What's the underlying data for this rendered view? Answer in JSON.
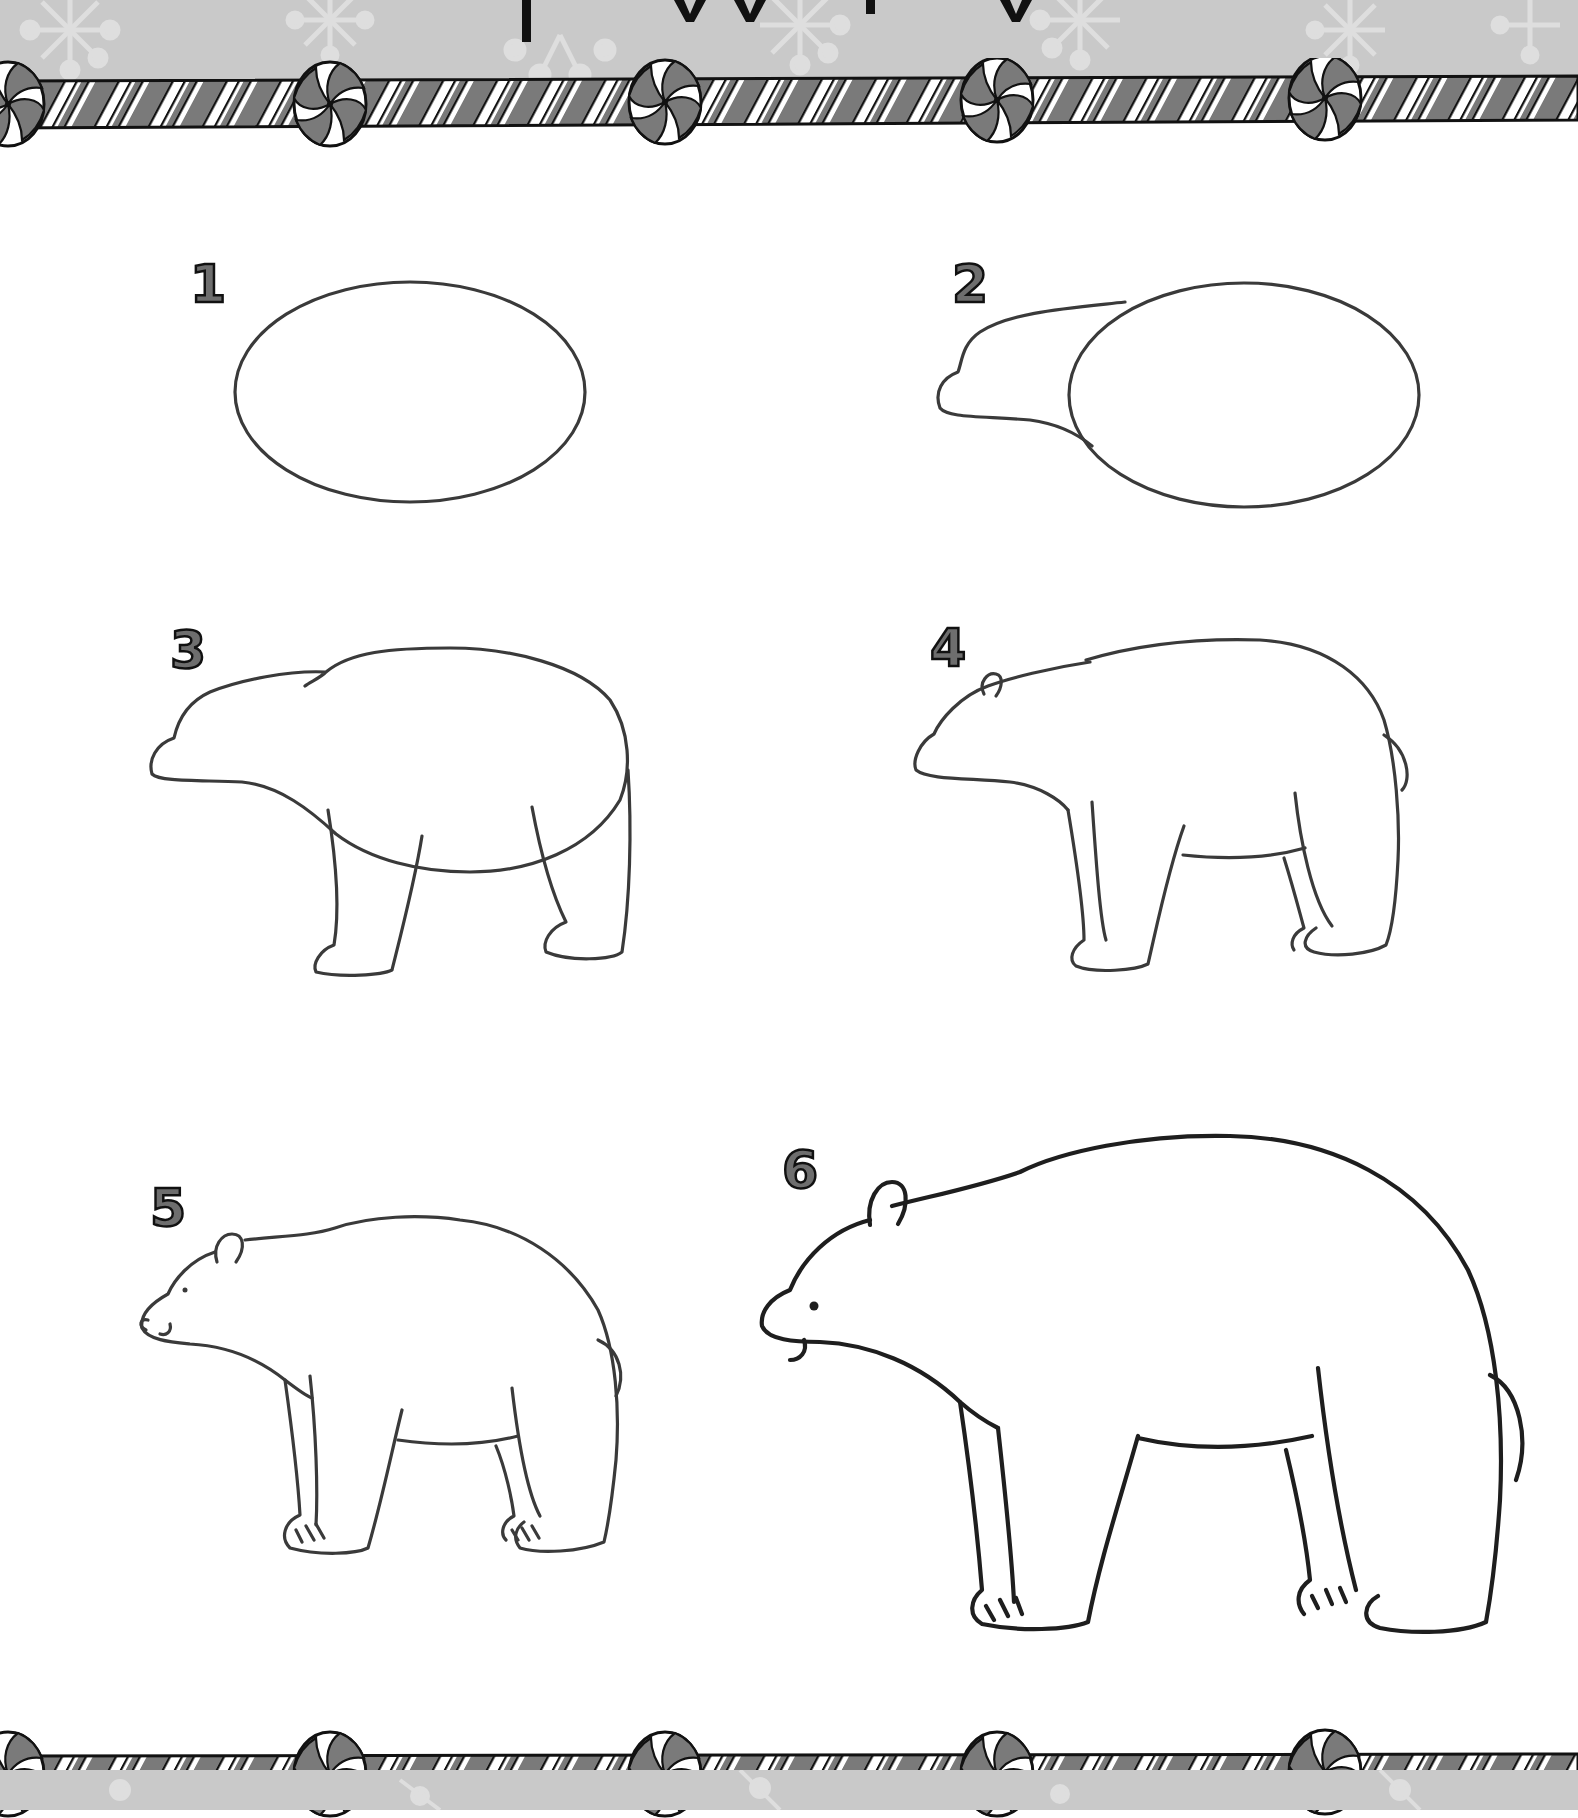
{
  "page": {
    "type": "how-to-draw activity page",
    "title_visible": "partially cropped at top edge",
    "colors": {
      "background": "#ffffff",
      "band_gray": "#c9c9c9",
      "snowflake": "#dedede",
      "stripe_dark": "#7a7a7a",
      "stripe_light": "#ffffff",
      "outline": "#1a1a1a",
      "pencil": "#3a3a3a",
      "shading": "#d4d4d4"
    }
  },
  "border": {
    "top": {
      "style": "candy-cane stripe",
      "peppermints": 5
    },
    "bottom": {
      "style": "candy-cane stripe",
      "peppermints": 5
    }
  },
  "steps": [
    {
      "number": "1",
      "description": "Oval body"
    },
    {
      "number": "2",
      "description": "Head and snout added to oval"
    },
    {
      "number": "3",
      "description": "Back contour and legs"
    },
    {
      "number": "4",
      "description": "Ear, tail, inner legs and belly line"
    },
    {
      "number": "5",
      "description": "Eye, nose, mouth and claws"
    },
    {
      "number": "6",
      "description": "Finished bear with shading"
    }
  ]
}
